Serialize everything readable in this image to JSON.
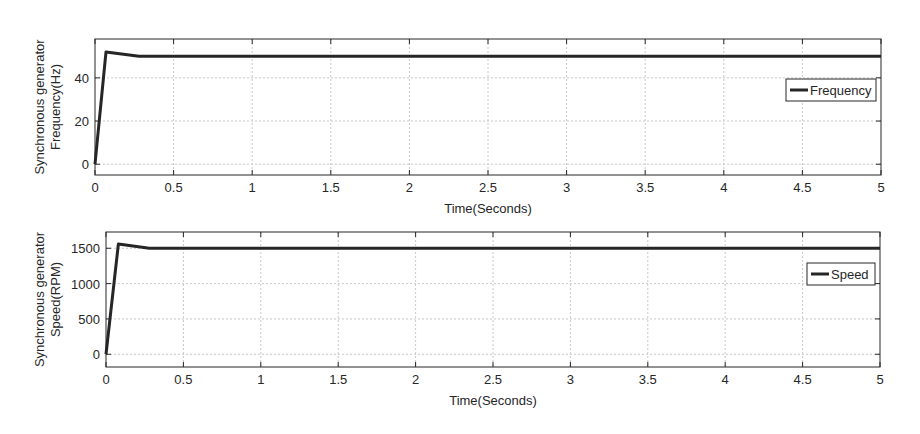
{
  "chart_data": [
    {
      "type": "line",
      "title": "",
      "xlabel": "Time(Seconds)",
      "ylabel_line1": "Synchronous generator",
      "ylabel_line2": "Frequency(Hz)",
      "xlim": [
        0,
        5
      ],
      "ylim": [
        -5,
        58
      ],
      "xticks": [
        0,
        0.5,
        1,
        1.5,
        2,
        2.5,
        3,
        3.5,
        4,
        4.5,
        5
      ],
      "xtick_labels": [
        "0",
        "0.5",
        "1",
        "1.5",
        "2",
        "2.5",
        "3",
        "3.5",
        "4",
        "4.5",
        "5"
      ],
      "yticks": [
        0,
        20,
        40
      ],
      "ytick_labels": [
        "0",
        "20",
        "40"
      ],
      "grid": true,
      "legend_position": "east",
      "series": [
        {
          "name": "Frequency",
          "color": "#262626",
          "x": [
            0,
            0.07,
            0.28,
            1,
            2,
            3,
            4,
            5
          ],
          "y": [
            0,
            52,
            50,
            50,
            50,
            50,
            50,
            50
          ]
        }
      ]
    },
    {
      "type": "line",
      "title": "",
      "xlabel": "Time(Seconds)",
      "ylabel_line1": "Synchronous generator",
      "ylabel_line2": "Speed(RPM)",
      "xlim": [
        0,
        5
      ],
      "ylim": [
        -180,
        1730
      ],
      "xticks": [
        0,
        0.5,
        1,
        1.5,
        2,
        2.5,
        3,
        3.5,
        4,
        4.5,
        5
      ],
      "xtick_labels": [
        "0",
        "0.5",
        "1",
        "1.5",
        "2",
        "2.5",
        "3",
        "3.5",
        "4",
        "4.5",
        "5"
      ],
      "yticks": [
        0,
        500,
        1000,
        1500
      ],
      "ytick_labels": [
        "0",
        "500",
        "1000",
        "1500"
      ],
      "grid": true,
      "legend_position": "east",
      "series": [
        {
          "name": "Speed",
          "color": "#262626",
          "x": [
            0,
            0.08,
            0.28,
            1,
            2,
            3,
            4,
            5
          ],
          "y": [
            0,
            1560,
            1500,
            1500,
            1500,
            1500,
            1500,
            1500
          ]
        }
      ]
    }
  ],
  "layout": [
    {
      "left": 95,
      "top": 39,
      "right": 881,
      "bottom": 175
    },
    {
      "left": 106,
      "top": 232,
      "right": 880,
      "bottom": 367
    }
  ]
}
